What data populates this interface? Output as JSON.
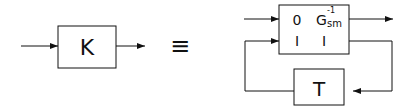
{
  "diagram": {
    "left_block": {
      "label": "K"
    },
    "equivalence_symbol": "≡",
    "main_block": {
      "matrix": [
        [
          "0",
          "G"
        ],
        [
          "I",
          "I"
        ]
      ],
      "g_subscript": "sm",
      "g_superscript": "-1"
    },
    "feedback_block": {
      "label": "T"
    }
  }
}
